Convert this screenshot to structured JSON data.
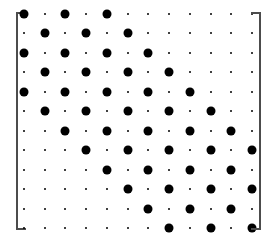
{
  "figure": {
    "kind": "matrix-dot-plot",
    "bracket_style": "square-brackets",
    "bracket_color": "#4c4c4c",
    "dot_color": "#000000",
    "background_color": "#ffffff",
    "rows": 12,
    "cols": 12,
    "large_dot_diameter": 9,
    "small_dot_diameter": 2
  },
  "chart_data": {
    "type": "heatmap",
    "title": "",
    "subtitle": "",
    "xlabel": "",
    "ylabel": "",
    "legend": [],
    "annotations": [],
    "grid": false,
    "x": [
      1,
      2,
      3,
      4,
      5,
      6,
      7,
      8,
      9,
      10,
      11,
      12
    ],
    "y": [
      1,
      2,
      3,
      4,
      5,
      6,
      7,
      8,
      9,
      10,
      11,
      12
    ],
    "xlim": [
      1,
      12
    ],
    "ylim": [
      1,
      12
    ],
    "xtick_labels": [],
    "ytick_labels": [],
    "value_encoding": "dot-area",
    "value_levels": {
      "large": 1,
      "small": 0
    },
    "values": [
      [
        1,
        0,
        1,
        0,
        1,
        0,
        0,
        0,
        0,
        0,
        0,
        0
      ],
      [
        0,
        1,
        0,
        1,
        0,
        1,
        0,
        0,
        0,
        0,
        0,
        0
      ],
      [
        1,
        0,
        1,
        0,
        1,
        0,
        1,
        0,
        0,
        0,
        0,
        0
      ],
      [
        0,
        1,
        0,
        1,
        0,
        1,
        0,
        1,
        0,
        0,
        0,
        0
      ],
      [
        1,
        0,
        1,
        0,
        1,
        0,
        1,
        0,
        1,
        0,
        0,
        0
      ],
      [
        0,
        1,
        0,
        1,
        0,
        1,
        0,
        1,
        0,
        1,
        0,
        0
      ],
      [
        0,
        0,
        1,
        0,
        1,
        0,
        1,
        0,
        1,
        0,
        1,
        0
      ],
      [
        0,
        0,
        0,
        1,
        0,
        1,
        0,
        1,
        0,
        1,
        0,
        1
      ],
      [
        0,
        0,
        0,
        0,
        1,
        0,
        1,
        0,
        1,
        0,
        1,
        0
      ],
      [
        0,
        0,
        0,
        0,
        0,
        1,
        0,
        1,
        0,
        1,
        0,
        1
      ],
      [
        0,
        0,
        0,
        0,
        0,
        0,
        1,
        0,
        1,
        0,
        1,
        0
      ],
      [
        0,
        0,
        0,
        0,
        0,
        0,
        0,
        1,
        0,
        1,
        0,
        1
      ]
    ]
  }
}
